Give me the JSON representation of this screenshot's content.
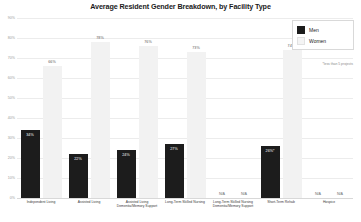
{
  "chart_data": {
    "type": "bar",
    "title": "Average Resident Gender Breakdown, by Facility Type",
    "xlabel": "",
    "ylabel": "",
    "ylim": [
      0,
      90
    ],
    "grid": true,
    "legend_position": "top-right",
    "ytick_labels": [
      "0%",
      "10%",
      "20%",
      "30%",
      "40%",
      "50%",
      "60%",
      "70%",
      "80%",
      "90%"
    ],
    "yticks": [
      0,
      10,
      20,
      30,
      40,
      50,
      60,
      70,
      80,
      90
    ],
    "categories": [
      "Independent Living",
      "Assisted Living",
      "Assisted Living Dementia/Memory Support",
      "Long-Term Skilled Nursing",
      "Long-Term Skilled Nursing Dementia/Memory Support",
      "Short-Term Rehab",
      "Hospice"
    ],
    "series": [
      {
        "name": "Men",
        "color": "#1c1c1c",
        "values": [
          34,
          22,
          24,
          27,
          null,
          26,
          null
        ],
        "labels": [
          "34%",
          "22%",
          "24%",
          "27%",
          "N/A",
          "26%*",
          "N/A"
        ]
      },
      {
        "name": "Women",
        "color": "#f2f2f2",
        "values": [
          66,
          78,
          76,
          73,
          null,
          74,
          null
        ],
        "labels": [
          "66%",
          "78%",
          "76%",
          "73%",
          "N/A",
          "74%*",
          "N/A"
        ]
      }
    ],
    "annotations": [
      "*less than 5 projects"
    ]
  },
  "legend": {
    "items": [
      {
        "label": "Men",
        "key": "men"
      },
      {
        "label": "Women",
        "key": "women"
      }
    ]
  },
  "footnote": "*less than 5 projects",
  "xaxis": {
    "labels": [
      {
        "line1": "Independent Living",
        "line2": ""
      },
      {
        "line1": "Assisted Living",
        "line2": ""
      },
      {
        "line1": "Assisted Living",
        "line2": "Dementia/Memory Support"
      },
      {
        "line1": "Long-Term Skilled Nursing",
        "line2": ""
      },
      {
        "line1": "Long-Term Skilled Nursing",
        "line2": "Dementia/Memory Support"
      },
      {
        "line1": "Short-Term Rehab",
        "line2": ""
      },
      {
        "line1": "Hospice",
        "line2": ""
      }
    ]
  }
}
